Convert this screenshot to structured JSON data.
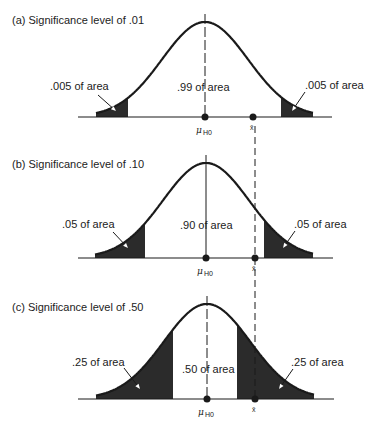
{
  "figure": {
    "colors": {
      "ink": "#1a1a1a",
      "shade": "#2b2b2b",
      "background": "#ffffff"
    },
    "xbar_line": {
      "x": 255,
      "y1": 126,
      "y2": 402,
      "dash": "7,4"
    },
    "mean_label": "μ",
    "mean_subscript": "H0",
    "xbar_label": "x̄",
    "panels": [
      {
        "id": "a",
        "title": "(a) Significance level of .01",
        "significance": 0.01,
        "title_pos": [
          12,
          24
        ],
        "baseline_y": 117,
        "peak_y": 22,
        "center_x": 205,
        "sigma_px": 43,
        "axis_x": [
          78,
          332
        ],
        "curve_x": [
          96,
          313
        ],
        "left_shade": [
          96,
          128
        ],
        "right_shade": [
          281,
          313
        ],
        "left_label": {
          "text": ".005 of area",
          "x": 50,
          "y": 90,
          "arrow": [
            [
              98,
              95
            ],
            [
              116,
              111
            ]
          ]
        },
        "center_label": {
          "text": ".99 of area",
          "x": 177,
          "y": 91
        },
        "right_label": {
          "text": ".005 of area",
          "x": 305,
          "y": 89,
          "arrow": [
            [
              305,
              92
            ],
            [
              292,
              111
            ]
          ]
        },
        "mean_dot_x": 205,
        "xbar_dot_x": 253,
        "centerline_dashed_top": true
      },
      {
        "id": "b",
        "title": "(b) Significance level of .10",
        "significance": 0.1,
        "title_pos": [
          12,
          168
        ],
        "baseline_y": 258,
        "peak_y": 163,
        "center_x": 206,
        "sigma_px": 43,
        "axis_x": [
          78,
          333
        ],
        "curve_x": [
          95,
          313
        ],
        "left_shade": [
          95,
          145
        ],
        "right_shade": [
          264,
          313
        ],
        "left_label": {
          "text": ".05 of area",
          "x": 62,
          "y": 228,
          "arrow": [
            [
              113,
              232
            ],
            [
              128,
              248
            ]
          ]
        },
        "center_label": {
          "text": ".90 of area",
          "x": 180,
          "y": 229
        },
        "right_label": {
          "text": ".05 of area",
          "x": 294,
          "y": 228,
          "arrow": [
            [
              295,
              231
            ],
            [
              283,
              248
            ]
          ]
        },
        "mean_dot_x": 206,
        "xbar_dot_x": 255,
        "centerline_dashed_top": false
      },
      {
        "id": "c",
        "title": "(c) Significance level of .50",
        "significance": 0.5,
        "title_pos": [
          12,
          311
        ],
        "baseline_y": 399,
        "peak_y": 304,
        "center_x": 207,
        "sigma_px": 43,
        "axis_x": [
          78,
          334
        ],
        "curve_x": [
          96,
          314
        ],
        "left_shade": [
          96,
          173
        ],
        "right_shade": [
          237,
          314
        ],
        "left_label": {
          "text": ".25 of area",
          "x": 72,
          "y": 366,
          "arrow": [
            [
              124,
              368
            ],
            [
              140,
              389
            ]
          ]
        },
        "center_label": {
          "text": ".50 of area",
          "x": 182,
          "y": 373
        },
        "right_label": {
          "text": ".25 of area",
          "x": 291,
          "y": 366,
          "arrow": [
            [
              293,
              369
            ],
            [
              279,
              389
            ]
          ]
        },
        "mean_dot_x": 207,
        "xbar_dot_x": 255,
        "centerline_dashed_top": true
      }
    ]
  }
}
